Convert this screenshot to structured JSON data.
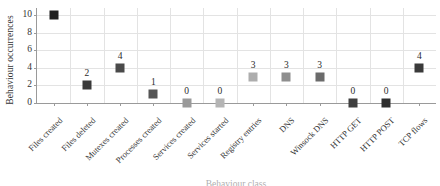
{
  "chart_data": {
    "type": "scatter",
    "title": "",
    "subtitle": "",
    "xlabel": "Behaviour class",
    "ylabel": "Behaviour occurrences",
    "categories": [
      "Files created",
      "Files deleted",
      "Mutexes created",
      "Processes created",
      "Services created",
      "Services started",
      "Registry entries",
      "DNS",
      "Winsock DNS",
      "HTTP GET",
      "HTTP POST",
      "TCP flows"
    ],
    "values": [
      10,
      2,
      4,
      1,
      0,
      0,
      3,
      3,
      3,
      0,
      0,
      4
    ],
    "point_labels": [
      "10",
      "2",
      "4",
      "1",
      "0",
      "0",
      "3",
      "3",
      "3",
      "0",
      "0",
      "4"
    ],
    "point_label_visible": [
      false,
      true,
      true,
      true,
      true,
      true,
      true,
      true,
      true,
      true,
      true,
      true
    ],
    "point_colors": [
      "#1f1f1f",
      "#3a3a3a",
      "#4a4a4a",
      "#555555",
      "#9a9a9a",
      "#b5b5b5",
      "#adadad",
      "#8e8e8e",
      "#6b6b6b",
      "#3f3f3f",
      "#2e2e2e",
      "#3a3a3a"
    ],
    "ylim": [
      0,
      10.8
    ],
    "yticks": [
      0,
      2,
      4,
      6,
      8,
      10
    ],
    "ytick_labels": [
      "0",
      "2",
      "4",
      "6",
      "8",
      "10"
    ],
    "grid": true,
    "grid_axis": "both",
    "legend": false,
    "marker": "square"
  },
  "axes": {
    "y_title": "Behaviour occurrences",
    "x_title": "Behaviour class"
  }
}
